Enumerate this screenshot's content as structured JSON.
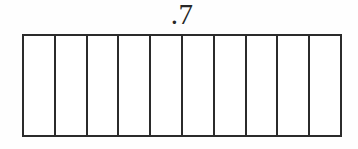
{
  "diagram": {
    "kind": "decimal-bar-model",
    "label": ".7",
    "total_cells": 10,
    "shaded_cells": 0,
    "colors": {
      "stroke": "#2b2b2b",
      "cell_fill": "#ffffff",
      "shaded_fill": "#2b2b2b",
      "background": "#fefefe",
      "label_text": "#272727"
    },
    "cells": [
      {
        "index": 1,
        "shaded": false
      },
      {
        "index": 2,
        "shaded": false
      },
      {
        "index": 3,
        "shaded": false
      },
      {
        "index": 4,
        "shaded": false
      },
      {
        "index": 5,
        "shaded": false
      },
      {
        "index": 6,
        "shaded": false
      },
      {
        "index": 7,
        "shaded": false
      },
      {
        "index": 8,
        "shaded": false
      },
      {
        "index": 9,
        "shaded": false
      },
      {
        "index": 10,
        "shaded": false
      }
    ]
  }
}
